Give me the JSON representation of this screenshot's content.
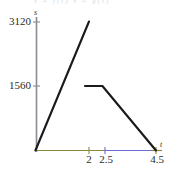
{
  "figure": {
    "faint_header_text": "s = f(t)   s = g(t)",
    "background_color": "#ffffff",
    "line_color": "#1a1a1a",
    "axis_color": "#8b8b93",
    "axis_tint_left_color": "#8a8a3c",
    "axis_tint_right_color": "#6b6bd8"
  },
  "chart_data": {
    "type": "line",
    "title": "",
    "xlabel": "t",
    "ylabel": "s",
    "xlim": [
      0,
      5.0
    ],
    "ylim": [
      0,
      3500
    ],
    "grid": false,
    "legend": "none",
    "xticks": [
      2,
      2.5,
      4.5
    ],
    "xtick_labels": [
      "2",
      "2.5",
      "4.5"
    ],
    "yticks": [
      1560,
      3120
    ],
    "ytick_labels": [
      "1560",
      "3120"
    ],
    "series": [
      {
        "name": "rising-line",
        "points": [
          [
            0,
            0
          ],
          [
            2,
            3120
          ]
        ]
      },
      {
        "name": "plateau-descending-line",
        "points": [
          [
            1.85,
            1560
          ],
          [
            2.5,
            1560
          ],
          [
            4.5,
            0
          ]
        ]
      }
    ]
  }
}
